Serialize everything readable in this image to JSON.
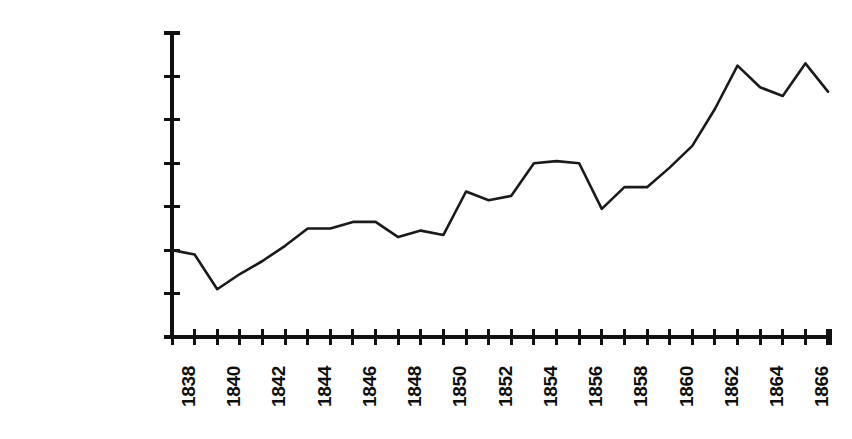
{
  "chart_data": {
    "type": "line",
    "title": "",
    "subtitle": "",
    "xlabel": "",
    "ylabel": "",
    "grid": false,
    "legend": false,
    "legend_position": "none",
    "xlim": [
      1838,
      1867
    ],
    "ylim": [
      0,
      140000000
    ],
    "ytick_labels": [
      "140000000",
      "120000000",
      "100000000",
      "80000000",
      "60000000",
      "40000000",
      "20000000",
      "0"
    ],
    "ytick_values": [
      140000000,
      120000000,
      100000000,
      80000000,
      60000000,
      40000000,
      20000000,
      0
    ],
    "xtick_labels": [
      "1838",
      "1840",
      "1842",
      "1844",
      "1846",
      "1848",
      "1850",
      "1852",
      "1854",
      "1856",
      "1858",
      "1860",
      "1862",
      "1864",
      "1866"
    ],
    "xtick_values": [
      1838,
      1840,
      1842,
      1844,
      1846,
      1848,
      1850,
      1852,
      1854,
      1856,
      1858,
      1860,
      1862,
      1864,
      1866
    ],
    "x": [
      1838,
      1839,
      1840,
      1841,
      1842,
      1843,
      1844,
      1845,
      1846,
      1847,
      1848,
      1849,
      1850,
      1851,
      1852,
      1853,
      1854,
      1855,
      1856,
      1857,
      1858,
      1859,
      1860,
      1861,
      1862,
      1863,
      1864,
      1865,
      1866,
      1867
    ],
    "values": [
      40000000,
      38000000,
      22000000,
      29000000,
      35000000,
      42000000,
      50000000,
      50000000,
      53000000,
      53000000,
      46000000,
      49000000,
      47000000,
      67000000,
      63000000,
      65000000,
      80000000,
      81000000,
      80000000,
      59000000,
      69000000,
      69000000,
      78000000,
      88000000,
      105000000,
      125000000,
      115000000,
      111000000,
      126000000,
      113000000
    ],
    "series_name": "value",
    "line_color": "#1a1a1a",
    "axis_color": "#111111",
    "background": "#ffffff"
  },
  "plot_geometry": {
    "axis_x": 172,
    "axis_y_top": 33,
    "axis_y_bottom": 337,
    "axis_x_right": 830,
    "x_step": 22.62,
    "y_per_unit": 43.4
  }
}
